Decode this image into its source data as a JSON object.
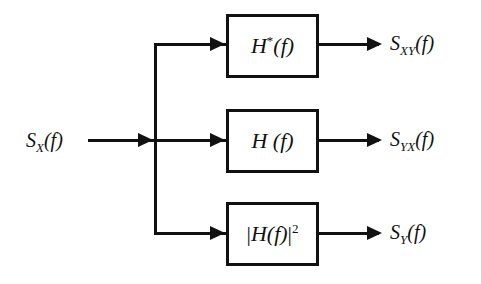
{
  "diagram": {
    "type": "signal-processing-block-diagram",
    "background_color": "#ffffff",
    "stroke_color": "#111111",
    "input": {
      "label_base": "S",
      "label_subscript": "XY",
      "label_text": "S",
      "subscript": "X",
      "argument": "(f)"
    },
    "blocks": [
      {
        "id": "conjugate-filter",
        "base": "H",
        "superscript": "*",
        "argument": "(f)",
        "prefix": "",
        "suffix": ""
      },
      {
        "id": "filter",
        "base": "H",
        "superscript": "",
        "argument": " (f)",
        "prefix": "",
        "suffix": ""
      },
      {
        "id": "magnitude-squared-filter",
        "base": "H",
        "superscript": "2",
        "argument": "(f)",
        "prefix": "|",
        "suffix": "|"
      }
    ],
    "outputs": [
      {
        "id": "cross-spectrum-xy",
        "base": "S",
        "subscript": "XY",
        "argument": "(f)"
      },
      {
        "id": "cross-spectrum-yx",
        "base": "S",
        "subscript": "YX",
        "argument": "(f)"
      },
      {
        "id": "output-spectrum-y",
        "base": "S",
        "subscript": "Y",
        "argument": "(f)"
      }
    ]
  }
}
